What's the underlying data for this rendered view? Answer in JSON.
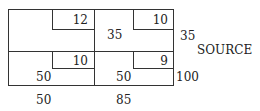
{
  "diagram": {
    "type": "transportation-tableau",
    "label_right": "SOURCE",
    "rows": [
      {
        "supply": "35",
        "cells": [
          {
            "cost": "12",
            "allocation": ""
          },
          {
            "cost": "10",
            "allocation": "35"
          }
        ]
      },
      {
        "supply": "100",
        "cells": [
          {
            "cost": "10",
            "allocation": "50"
          },
          {
            "cost": "9",
            "allocation": "50"
          }
        ]
      }
    ],
    "demands": [
      "50",
      "85"
    ]
  }
}
